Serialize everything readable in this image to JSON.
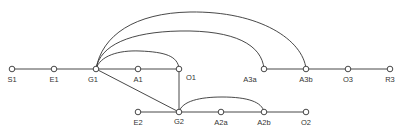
{
  "caption": "",
  "colors": {
    "stroke": "#333333",
    "background": "#ffffff"
  },
  "nodes": [
    {
      "id": "S1",
      "label": "S1",
      "x": 12,
      "y": 69,
      "label_dx": 0,
      "label_dy": 13
    },
    {
      "id": "E1",
      "label": "E1",
      "x": 54,
      "y": 69,
      "label_dx": 0,
      "label_dy": 13
    },
    {
      "id": "G1",
      "label": "G1",
      "x": 96,
      "y": 69,
      "label_dx": -3,
      "label_dy": 13
    },
    {
      "id": "A1",
      "label": "A1",
      "x": 138,
      "y": 69,
      "label_dx": 0,
      "label_dy": 13
    },
    {
      "id": "O1",
      "label": "O1",
      "x": 179,
      "y": 69,
      "label_dx": 12,
      "label_dy": 11
    },
    {
      "id": "A3a",
      "label": "A3a",
      "x": 264,
      "y": 69,
      "label_dx": -14,
      "label_dy": 13
    },
    {
      "id": "A3b",
      "label": "A3b",
      "x": 306,
      "y": 69,
      "label_dx": 0,
      "label_dy": 13
    },
    {
      "id": "O3",
      "label": "O3",
      "x": 348,
      "y": 69,
      "label_dx": 0,
      "label_dy": 13
    },
    {
      "id": "R3",
      "label": "R3",
      "x": 390,
      "y": 69,
      "label_dx": 0,
      "label_dy": 13
    },
    {
      "id": "E2",
      "label": "E2",
      "x": 138,
      "y": 112,
      "label_dx": 0,
      "label_dy": 13
    },
    {
      "id": "G2",
      "label": "G2",
      "x": 179,
      "y": 112,
      "label_dx": 0,
      "label_dy": 12
    },
    {
      "id": "A2a",
      "label": "A2a",
      "x": 221,
      "y": 112,
      "label_dx": 0,
      "label_dy": 13
    },
    {
      "id": "A2b",
      "label": "A2b",
      "x": 264,
      "y": 112,
      "label_dx": 0,
      "label_dy": 13
    },
    {
      "id": "O2",
      "label": "O2",
      "x": 306,
      "y": 112,
      "label_dx": 0,
      "label_dy": 13
    }
  ],
  "edges": [
    {
      "from": "S1",
      "to": "E1",
      "type": "line"
    },
    {
      "from": "E1",
      "to": "G1",
      "type": "line"
    },
    {
      "from": "G1",
      "to": "A1",
      "type": "line"
    },
    {
      "from": "A1",
      "to": "O1",
      "type": "line"
    },
    {
      "from": "G1",
      "to": "G2",
      "type": "line"
    },
    {
      "from": "O1",
      "to": "G2",
      "type": "line"
    },
    {
      "from": "A3a",
      "to": "A3b",
      "type": "line"
    },
    {
      "from": "A3b",
      "to": "O3",
      "type": "line"
    },
    {
      "from": "O3",
      "to": "R3",
      "type": "line"
    },
    {
      "from": "E2",
      "to": "G2",
      "type": "line"
    },
    {
      "from": "G2",
      "to": "A2a",
      "type": "line"
    },
    {
      "from": "A2a",
      "to": "A2b",
      "type": "line"
    },
    {
      "from": "A2b",
      "to": "O2",
      "type": "line"
    },
    {
      "from": "G1",
      "to": "O1",
      "type": "arc",
      "path": "M96,69 C100,56 118,50 140,51 C165,52 178,56 179,69"
    },
    {
      "from": "G1",
      "to": "A3a",
      "type": "arc",
      "path": "M96,69 C100,45 130,32 180,31 C235,30 262,45 264,69"
    },
    {
      "from": "G1",
      "to": "A3b",
      "type": "arc",
      "path": "M96,69 C102,35 135,13 190,12 C260,11 303,40 306,69"
    },
    {
      "from": "G2",
      "to": "A2b",
      "type": "arc",
      "path": "M179,112 C182,101 200,97 222,97 C248,97 262,102 264,112"
    }
  ]
}
